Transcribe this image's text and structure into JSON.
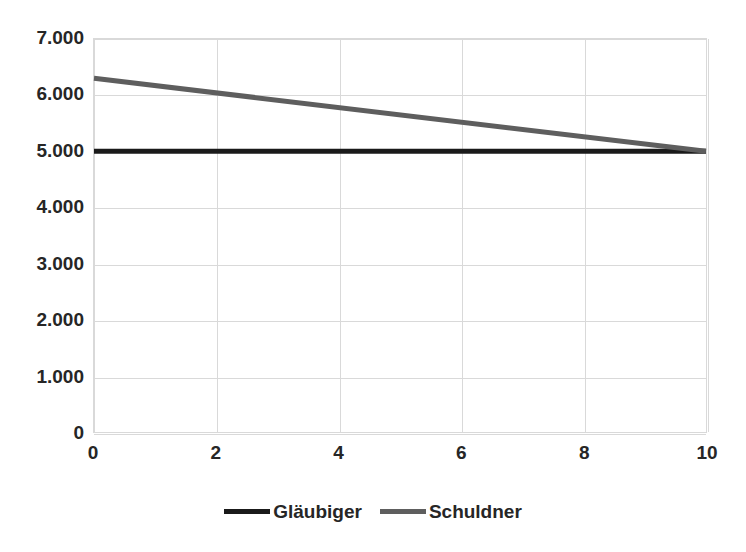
{
  "chart_data": {
    "type": "line",
    "title": "",
    "subtitle": "",
    "xlabel": "",
    "ylabel": "",
    "xlim": [
      0,
      10
    ],
    "ylim": [
      0,
      7000
    ],
    "grid": true,
    "legend_position": "bottom",
    "x_tick_labels": [
      "0",
      "2",
      "4",
      "6",
      "8",
      "10"
    ],
    "x_tick_values": [
      0,
      2,
      4,
      6,
      8,
      10
    ],
    "y_tick_labels": [
      "7.000",
      "6.000",
      "5.000",
      "4.000",
      "3.000",
      "2.000",
      "1.000",
      "0"
    ],
    "y_tick_values": [
      7000,
      6000,
      5000,
      4000,
      3000,
      2000,
      1000,
      0
    ],
    "x": [
      0,
      10
    ],
    "series": [
      {
        "name": "Gläubiger",
        "color": "#1a1a1a",
        "width": 5,
        "values": [
          5000,
          5000
        ]
      },
      {
        "name": "Schuldner",
        "color": "#5e5e5e",
        "width": 5,
        "values": [
          6300,
          5000
        ]
      }
    ]
  },
  "legend": {
    "entries": [
      {
        "label": "Gläubiger",
        "color": "#1a1a1a"
      },
      {
        "label": "Schuldner",
        "color": "#5e5e5e"
      }
    ]
  },
  "axes": {
    "y_labels": [
      "7.000",
      "6.000",
      "5.000",
      "4.000",
      "3.000",
      "2.000",
      "1.000",
      "0"
    ],
    "x_labels": [
      "0",
      "2",
      "4",
      "6",
      "8",
      "10"
    ]
  },
  "style": {
    "grid_color": "#d9d9d9",
    "border_color": "#d9d9d9",
    "text_color": "#262626",
    "background": "#ffffff"
  }
}
